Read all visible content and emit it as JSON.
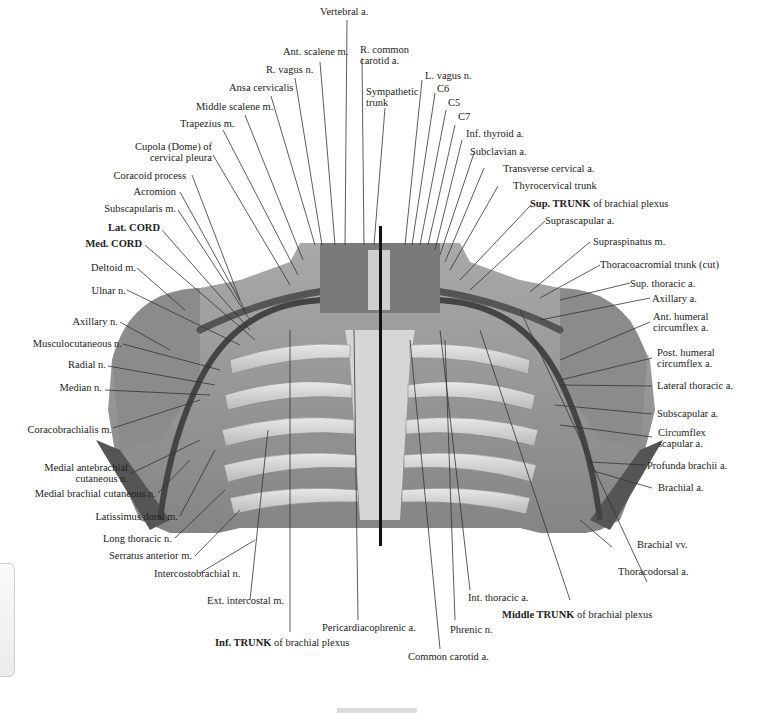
{
  "figure": {
    "labels_top": [
      {
        "id": "vertebral-a",
        "text": "Vertebral a."
      },
      {
        "id": "ant-scalene-m",
        "text": "Ant. scalene m."
      },
      {
        "id": "r-common-carotid-a",
        "text": "R. common\ncarotid a."
      },
      {
        "id": "r-vagus-n",
        "text": "R. vagus n."
      },
      {
        "id": "ansa-cervicalis",
        "text": "Ansa cervicalis"
      },
      {
        "id": "sympathetic-trunk",
        "text": "Sympathetic\ntrunk"
      },
      {
        "id": "l-vagus-n",
        "text": "L. vagus n."
      },
      {
        "id": "c6",
        "text": "C6"
      },
      {
        "id": "c5",
        "text": "C5"
      },
      {
        "id": "c7",
        "text": "C7"
      },
      {
        "id": "middle-scalene-m",
        "text": "Middle scalene m."
      },
      {
        "id": "trapezius-m",
        "text": "Trapezius m."
      }
    ],
    "labels_left": [
      {
        "id": "cupola",
        "text": "Cupola (Dome) of\ncervical pleura"
      },
      {
        "id": "coracoid-process",
        "text": "Coracoid process"
      },
      {
        "id": "acromion",
        "text": "Acromion"
      },
      {
        "id": "subscapularis-m",
        "text": "Subscapularis m."
      },
      {
        "id": "lat-cord",
        "bold": "Lat. CORD",
        "text": ""
      },
      {
        "id": "med-cord",
        "bold": "Med. CORD",
        "text": ""
      },
      {
        "id": "deltoid-m",
        "text": "Deltoid m."
      },
      {
        "id": "ulnar-n",
        "text": "Ulnar n."
      },
      {
        "id": "axillary-n",
        "text": "Axillary n."
      },
      {
        "id": "musculocutaneous-n",
        "text": "Musculocutaneous n."
      },
      {
        "id": "radial-n",
        "text": "Radial n."
      },
      {
        "id": "median-n",
        "text": "Median n."
      },
      {
        "id": "coracobrachialis-m",
        "text": "Coracobrachialis m."
      },
      {
        "id": "medial-antebrachial-cutaneous-n",
        "text": "Medial antebrachial\ncutaneous n."
      },
      {
        "id": "medial-brachial-cutaneous-n",
        "text": "Medial brachial cutaneous n."
      },
      {
        "id": "latissimus-dorsi-m",
        "text": "Latissimus dorsi m."
      },
      {
        "id": "long-thoracic-n",
        "text": "Long thoracic n."
      },
      {
        "id": "serratus-anterior-m",
        "text": "Serratus anterior m."
      },
      {
        "id": "intercostobrachial-n",
        "text": "Intercostobrachial n."
      }
    ],
    "labels_right": [
      {
        "id": "inf-thyroid-a",
        "text": "Inf. thyroid a."
      },
      {
        "id": "subclavian-a",
        "text": "Subclavian a."
      },
      {
        "id": "transverse-cervical-a",
        "text": "Transverse cervical a."
      },
      {
        "id": "thyrocervical-trunk",
        "text": "Thyrocervical trunk"
      },
      {
        "id": "sup-trunk",
        "bold": "Sup. TRUNK",
        "text": " of brachial plexus"
      },
      {
        "id": "suprascapular-a",
        "text": "Suprascapular a."
      },
      {
        "id": "supraspinatus-m",
        "text": "Supraspinatus m."
      },
      {
        "id": "thoracoacromial-trunk",
        "text": "Thoracoacromial trunk (cut)"
      },
      {
        "id": "sup-thoracic-a",
        "text": "Sup. thoracic a."
      },
      {
        "id": "axillary-a",
        "text": "Axillary a."
      },
      {
        "id": "ant-humeral-circumflex-a",
        "text": "Ant. humeral\ncircumflex a."
      },
      {
        "id": "post-humeral-circumflex-a",
        "text": "Post. humeral\ncircumflex a."
      },
      {
        "id": "lateral-thoracic-a",
        "text": "Lateral thoracic a."
      },
      {
        "id": "subscapular-a",
        "text": "Subscapular a."
      },
      {
        "id": "circumflex-scapular-a",
        "text": "Circumflex\nscapular a."
      },
      {
        "id": "profunda-brachii-a",
        "text": "Profunda brachii a."
      },
      {
        "id": "brachial-a",
        "text": "Brachial a."
      },
      {
        "id": "brachial-vv",
        "text": "Brachial vv."
      },
      {
        "id": "thoracodorsal-a",
        "text": "Thoracodorsal a."
      }
    ],
    "labels_bottom": [
      {
        "id": "ext-intercostal-m",
        "text": "Ext. intercostal m."
      },
      {
        "id": "inf-trunk",
        "bold": "Inf. TRUNK",
        "text": " of brachial plexus"
      },
      {
        "id": "pericardiacophrenic-a",
        "text": "Pericardiacophrenic a."
      },
      {
        "id": "common-carotid-a",
        "text": "Common carotid a."
      },
      {
        "id": "phrenic-n",
        "text": "Phrenic n."
      },
      {
        "id": "int-thoracic-a",
        "text": "Int. thoracic a."
      },
      {
        "id": "middle-trunk",
        "bold": "Middle TRUNK",
        "text": " of brachial plexus"
      }
    ]
  },
  "viewer": {
    "side_tab": "collapsed-panel-tab",
    "scroll_indicator": "horizontal-scroll-thumb"
  }
}
